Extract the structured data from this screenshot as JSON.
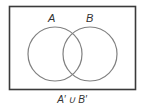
{
  "diagram": {
    "type": "venn",
    "universe": {
      "x": 9,
      "y": 6,
      "width": 126,
      "height": 83,
      "stroke": "#3a3a3a"
    },
    "sets": [
      {
        "label": "A",
        "cx": 55,
        "cy": 54,
        "r": 27,
        "stroke": "#808080"
      },
      {
        "label": "B",
        "cx": 90,
        "cy": 54,
        "r": 27,
        "stroke": "#808080"
      }
    ],
    "caption": "A′ ∪ B′"
  }
}
